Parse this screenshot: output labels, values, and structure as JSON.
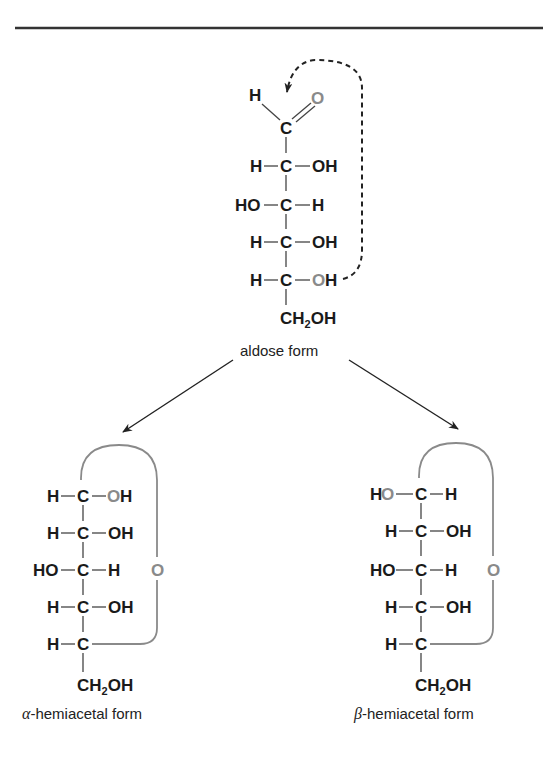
{
  "figure": {
    "aldose": {
      "label": "aldose form",
      "top": {
        "H": "H",
        "O": "O",
        "C": "C"
      },
      "rows": [
        {
          "left": "H",
          "center": "C",
          "right": "OH"
        },
        {
          "left": "HO",
          "center": "C",
          "right": "H"
        },
        {
          "left": "H",
          "center": "C",
          "right": "OH"
        },
        {
          "left": "H",
          "center": "C",
          "right": "OH"
        }
      ],
      "bottom": {
        "main": "CH",
        "sub": "2",
        "tail": "OH"
      }
    },
    "alpha": {
      "greek": "α",
      "label": "-hemiacetal form",
      "ring_oxygen": "O",
      "rows": [
        {
          "left": "H",
          "center": "C",
          "right": "OH"
        },
        {
          "left": "H",
          "center": "C",
          "right": "OH"
        },
        {
          "left": "HO",
          "center": "C",
          "right": "H"
        },
        {
          "left": "H",
          "center": "C",
          "right": "OH"
        },
        {
          "left": "H",
          "center": "C",
          "right": ""
        }
      ],
      "bottom": {
        "main": "CH",
        "sub": "2",
        "tail": "OH"
      }
    },
    "beta": {
      "greek": "β",
      "label": "-hemiacetal form",
      "ring_oxygen": "O",
      "rows": [
        {
          "left": "HO",
          "center": "C",
          "right": "H"
        },
        {
          "left": "H",
          "center": "C",
          "right": "OH"
        },
        {
          "left": "HO",
          "center": "C",
          "right": "H"
        },
        {
          "left": "H",
          "center": "C",
          "right": "OH"
        },
        {
          "left": "H",
          "center": "C",
          "right": ""
        }
      ],
      "bottom": {
        "main": "CH",
        "sub": "2",
        "tail": "OH"
      }
    },
    "colors": {
      "text": "#1a1a1a",
      "highlight": "#8a8a8a",
      "rule": "#333333"
    }
  }
}
